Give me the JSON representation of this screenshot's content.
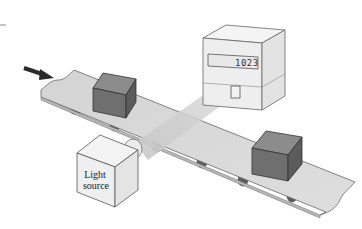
{
  "diagram": {
    "counter": {
      "display_value": "1023"
    },
    "light_source": {
      "label_line1": "Light",
      "label_line2": "source"
    },
    "flow_direction": "arrow pointing right-down along belt",
    "colors": {
      "belt": "#d8d8d8",
      "box_front": "#6f6f6f",
      "box_top": "#8a8a8a",
      "box_side": "#5d5d5d",
      "device": "#efefef",
      "device_side": "#e2e2e2",
      "beam": "#cfcfcf",
      "roller": "#5a5a5a",
      "outline": "#555555",
      "arrow": "#2a2a2a"
    }
  }
}
